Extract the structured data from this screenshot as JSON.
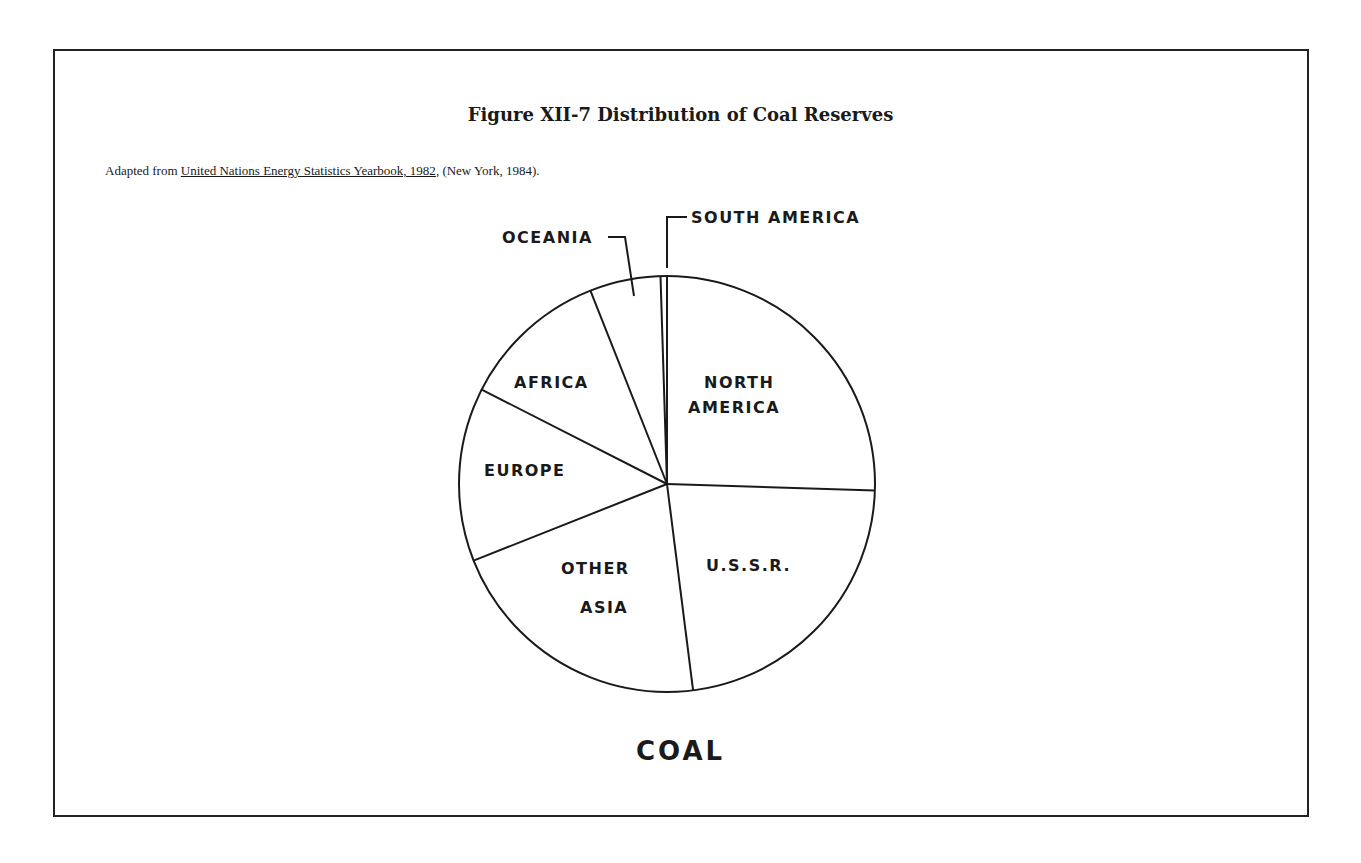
{
  "figure": {
    "title": "Figure XII-7  Distribution of Coal Reserves",
    "source_prefix": "Adapted from ",
    "source_title": "United Nations Energy Statistics Yearbook, 1982",
    "source_suffix": ", (New York, 1984).",
    "caption": "COAL"
  },
  "chart_data": {
    "type": "pie",
    "title": "Figure XII-7 Distribution of Coal Reserves",
    "subtitle": "Adapted from United Nations Energy Statistics Yearbook, 1982, (New York, 1984).",
    "caption": "COAL",
    "start_angle": "top (12 o'clock), clockwise",
    "slices": [
      {
        "label": "NORTH AMERICA",
        "value": 25.5
      },
      {
        "label": "U.S.S.R.",
        "value": 22.5
      },
      {
        "label": "OTHER ASIA",
        "value": 21.0
      },
      {
        "label": "EUROPE",
        "value": 13.5
      },
      {
        "label": "AFRICA",
        "value": 11.5
      },
      {
        "label": "OCEANIA",
        "value": 5.5
      },
      {
        "label": "SOUTH AMERICA",
        "value": 0.5
      }
    ],
    "units": "percent (estimated from slice angles)",
    "legend": "none (direct labels)"
  },
  "labels": {
    "north_america_1": "NORTH",
    "north_america_2": "AMERICA",
    "ussr": "U.S.S.R.",
    "other_asia_1": "OTHER",
    "other_asia_2": "ASIA",
    "europe": "EUROPE",
    "africa": "AFRICA",
    "oceania": "OCEANIA",
    "south_america": "SOUTH AMERICA"
  }
}
